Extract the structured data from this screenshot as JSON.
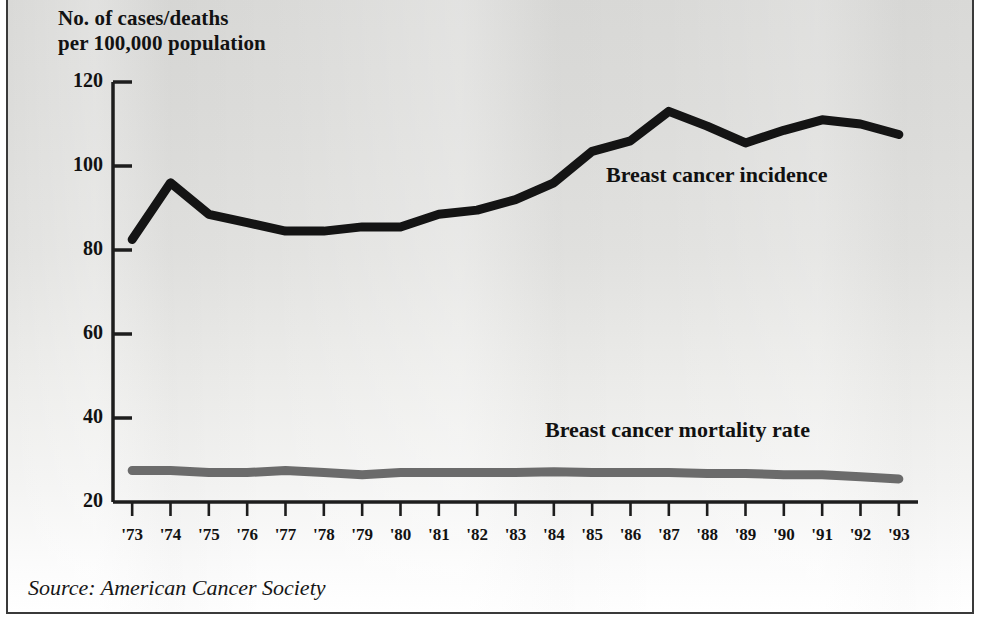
{
  "figure": {
    "axis_title": "No. of cases/deaths\nper 100,000 population",
    "source_note": "Source: American Cancer Society",
    "colors": {
      "incidence_line": "#141414",
      "mortality_line": "#6b6b6b",
      "axis": "#1d1d1d",
      "frame": "#3a3a3a",
      "background": "#e4e4e2"
    }
  },
  "chart_data": {
    "type": "line",
    "title": "",
    "subtitle": "",
    "xlabel": "",
    "ylabel": "No. of cases/deaths per 100,000 population",
    "source": "Source: American Cancer Society",
    "x": [
      "'73",
      "'74",
      "'75",
      "'76",
      "'77",
      "'78",
      "'79",
      "'80",
      "'81",
      "'82",
      "'83",
      "'84",
      "'85",
      "'86",
      "'87",
      "'88",
      "'89",
      "'90",
      "'91",
      "'92",
      "'93"
    ],
    "x_values": [
      1973,
      1974,
      1975,
      1976,
      1977,
      1978,
      1979,
      1980,
      1981,
      1982,
      1983,
      1984,
      1985,
      1986,
      1987,
      1988,
      1989,
      1990,
      1991,
      1992,
      1993
    ],
    "ylim": [
      20,
      120
    ],
    "yticks": [
      20,
      40,
      60,
      80,
      100,
      120
    ],
    "ytick_labels": [
      "20",
      "40",
      "60",
      "80",
      "100",
      "120"
    ],
    "grid": false,
    "legend": "inline-annotations",
    "series": [
      {
        "name": "Breast cancer incidence",
        "color": "#141414",
        "values": [
          82.5,
          96.0,
          88.5,
          86.5,
          84.5,
          84.5,
          85.5,
          85.5,
          88.5,
          89.5,
          92.0,
          96.0,
          103.5,
          106.0,
          113.0,
          109.5,
          105.5,
          108.5,
          111.0,
          110.0,
          107.5
        ]
      },
      {
        "name": "Breast cancer mortality rate",
        "color": "#6b6b6b",
        "values": [
          27.5,
          27.5,
          27.0,
          27.0,
          27.5,
          27.0,
          26.5,
          27.0,
          27.0,
          27.0,
          27.0,
          27.2,
          27.0,
          27.0,
          27.0,
          26.8,
          26.8,
          26.5,
          26.5,
          26.0,
          25.5
        ]
      }
    ]
  },
  "annotations": [
    {
      "name": "incidence-label",
      "text": "Breast cancer incidence"
    },
    {
      "name": "mortality-label",
      "text": "Breast cancer mortality rate"
    }
  ]
}
